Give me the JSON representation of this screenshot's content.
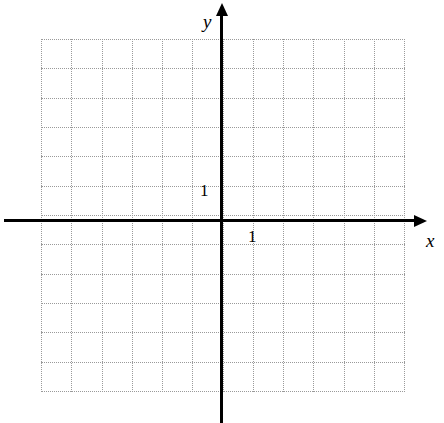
{
  "figure": {
    "background_color": "#ffffff",
    "width": 444,
    "height": 423
  },
  "axes": {
    "x_axis": {
      "label": "x",
      "color": "#000000",
      "origin_px": 221,
      "position_px": 220,
      "start_px": 4,
      "end_px": 414,
      "arrow": "right",
      "label_x_px": 426,
      "label_y_px": 231
    },
    "y_axis": {
      "label": "y",
      "color": "#000000",
      "origin_px": 220,
      "position_px": 221,
      "start_px": 16,
      "end_px": 423,
      "arrow": "up",
      "label_x_px": 203,
      "label_y_px": 12
    }
  },
  "ticks": {
    "x_tick": {
      "label": "1",
      "value": 1,
      "x_px": 248,
      "y_px": 228
    },
    "y_tick": {
      "label": "1",
      "value": 1,
      "x_px": 200,
      "y_px": 182
    }
  },
  "chart_data": {
    "type": "scatter",
    "title": "",
    "xlabel": "x",
    "ylabel": "y",
    "series": [],
    "x": [],
    "values": [],
    "xlim": [
      -6,
      6
    ],
    "ylim": [
      -6,
      6
    ],
    "xticks": [
      1
    ],
    "yticks": [
      1
    ],
    "xticklabels": [
      "1"
    ],
    "yticklabels": [
      "1"
    ],
    "grid": true,
    "grid_style": "dotted",
    "grid_color": "#9a9a9a",
    "grid_spacing_x_px": 30.25,
    "grid_spacing_y_px": 29.33,
    "grid_left_px": 41,
    "grid_top_px": 39,
    "grid_right_px": 404,
    "grid_bottom_px": 391,
    "grid_columns": 12,
    "grid_rows": 12,
    "legend": null,
    "annotations": []
  }
}
